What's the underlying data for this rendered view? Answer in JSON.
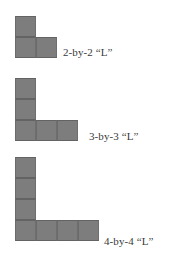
{
  "background_color": "#ffffff",
  "cell_color": "#7d7d7d",
  "cell_border_color": "#636363",
  "text_color": "#3a3a3a",
  "cell_size_px": 21,
  "figures": [
    {
      "id": "l-2-by-2",
      "label": "2-by-2 “L”",
      "arm_length": 2,
      "cells": [
        {
          "col": 0,
          "row": 0
        },
        {
          "col": 0,
          "row": 1
        },
        {
          "col": 1,
          "row": 1
        }
      ],
      "shape_left": 15,
      "shape_top": 16,
      "label_left": 63,
      "label_top": 46
    },
    {
      "id": "l-3-by-3",
      "label": "3-by-3 “L”",
      "arm_length": 3,
      "cells": [
        {
          "col": 0,
          "row": 0
        },
        {
          "col": 0,
          "row": 1
        },
        {
          "col": 0,
          "row": 2
        },
        {
          "col": 1,
          "row": 2
        },
        {
          "col": 2,
          "row": 2
        }
      ],
      "shape_left": 15,
      "shape_top": 78,
      "label_left": 89,
      "label_top": 130
    },
    {
      "id": "l-4-by-4",
      "label": "4-by-4 “L”",
      "arm_length": 4,
      "cells": [
        {
          "col": 0,
          "row": 0
        },
        {
          "col": 0,
          "row": 1
        },
        {
          "col": 0,
          "row": 2
        },
        {
          "col": 0,
          "row": 3
        },
        {
          "col": 1,
          "row": 3
        },
        {
          "col": 2,
          "row": 3
        },
        {
          "col": 3,
          "row": 3
        }
      ],
      "shape_left": 15,
      "shape_top": 157,
      "label_left": 104,
      "label_top": 235
    }
  ]
}
